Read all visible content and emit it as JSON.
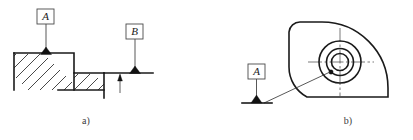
{
  "figure": {
    "captions": [
      {
        "id": "caption-a",
        "label": "a)",
        "x": 86,
        "y": 124
      },
      {
        "id": "caption-b",
        "label": "b)",
        "x": 348,
        "y": 124
      }
    ],
    "datum_boxes": [
      {
        "id": "datum-a-left",
        "letter": "A",
        "x": 37,
        "y": 9,
        "w": 17,
        "h": 15
      },
      {
        "id": "datum-b-left",
        "letter": "B",
        "x": 126,
        "y": 24,
        "w": 17,
        "h": 15
      },
      {
        "id": "datum-a-right",
        "letter": "A",
        "x": 248,
        "y": 64,
        "w": 17,
        "h": 15
      }
    ],
    "colors": {
      "outline": "#1a1a1a",
      "thin_line": "#2b2b2b",
      "hatch": "#1a1a1a",
      "leader": "#3a3a3a",
      "center_line": "#404040",
      "symbol_fill": "#111111",
      "box_stroke": "#4a4a4a",
      "background": "#ffffff",
      "text": "#1a1a1a"
    },
    "panel_a": {
      "name": "stepped-part-section",
      "description": "Sectioned stepped block with datum A on upper face and datum B on lower reference line",
      "upper_surface_y": 53,
      "lower_surface_y": 73,
      "left_edge_x": 14,
      "step_edge_x": 74,
      "hatch_bottom_y": 90,
      "datum_a_triangle_x": 46,
      "datum_b_triangle_x": 135,
      "reference_line": {
        "x1": 104,
        "x2": 153,
        "y": 73
      },
      "dimension_arrow": {
        "x": 120,
        "y_top": 76,
        "y_bottom": 92
      }
    },
    "panel_b": {
      "name": "cam-profile-view",
      "description": "Cam shaped outline with concentric bore circles, datum A pointing at the bore axis",
      "bore_center": {
        "x": 340,
        "y": 62
      },
      "circle_radii": [
        21,
        13.5,
        8.5
      ],
      "center_cross": {
        "h_x1": 308,
        "h_x2": 374,
        "v_y1": 27,
        "v_y2": 97
      },
      "datum_a_triangle_x": 256,
      "datum_a_triangle_y": 103,
      "leader_to_bore": {
        "x1": 264,
        "y1": 103,
        "x2": 330,
        "y2": 71
      },
      "outline_left_x": 289,
      "outline_top_y": 22,
      "outline_bottom_y": 97,
      "outline_right_x": 388
    }
  }
}
